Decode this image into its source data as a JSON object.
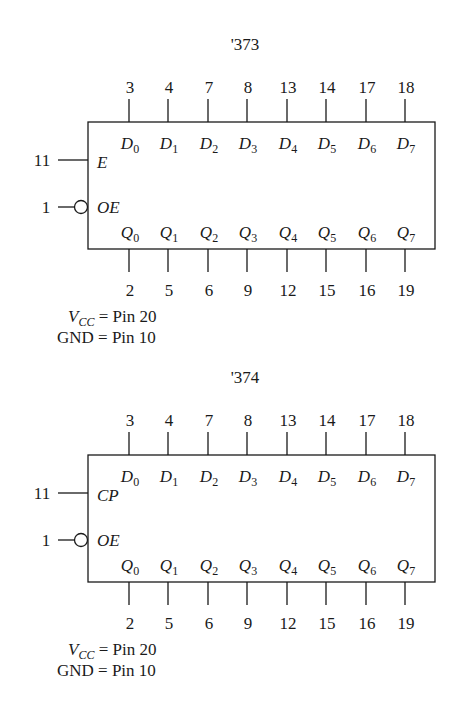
{
  "diagrams": [
    {
      "title": "'373",
      "control_top": {
        "pin": "11",
        "label": "E"
      },
      "control_bottom": {
        "pin": "1",
        "label": "OE",
        "inverted": true
      },
      "inputs": [
        {
          "pin": "3",
          "name": "D",
          "sub": "0"
        },
        {
          "pin": "4",
          "name": "D",
          "sub": "1"
        },
        {
          "pin": "7",
          "name": "D",
          "sub": "2"
        },
        {
          "pin": "8",
          "name": "D",
          "sub": "3"
        },
        {
          "pin": "13",
          "name": "D",
          "sub": "4"
        },
        {
          "pin": "14",
          "name": "D",
          "sub": "5"
        },
        {
          "pin": "17",
          "name": "D",
          "sub": "6"
        },
        {
          "pin": "18",
          "name": "D",
          "sub": "7"
        }
      ],
      "outputs": [
        {
          "pin": "2",
          "name": "Q",
          "sub": "0"
        },
        {
          "pin": "5",
          "name": "Q",
          "sub": "1"
        },
        {
          "pin": "6",
          "name": "Q",
          "sub": "2"
        },
        {
          "pin": "9",
          "name": "Q",
          "sub": "3"
        },
        {
          "pin": "12",
          "name": "Q",
          "sub": "4"
        },
        {
          "pin": "15",
          "name": "Q",
          "sub": "5"
        },
        {
          "pin": "16",
          "name": "Q",
          "sub": "6"
        },
        {
          "pin": "19",
          "name": "Q",
          "sub": "7"
        }
      ],
      "power": {
        "vcc_label": "V",
        "vcc_sub": "CC",
        "vcc_text": " = Pin 20",
        "gnd_text": "GND = Pin 10"
      }
    },
    {
      "title": "'374",
      "control_top": {
        "pin": "11",
        "label": "CP"
      },
      "control_bottom": {
        "pin": "1",
        "label": "OE",
        "inverted": true
      },
      "inputs": [
        {
          "pin": "3",
          "name": "D",
          "sub": "0"
        },
        {
          "pin": "4",
          "name": "D",
          "sub": "1"
        },
        {
          "pin": "7",
          "name": "D",
          "sub": "2"
        },
        {
          "pin": "8",
          "name": "D",
          "sub": "3"
        },
        {
          "pin": "13",
          "name": "D",
          "sub": "4"
        },
        {
          "pin": "14",
          "name": "D",
          "sub": "5"
        },
        {
          "pin": "17",
          "name": "D",
          "sub": "6"
        },
        {
          "pin": "18",
          "name": "D",
          "sub": "7"
        }
      ],
      "outputs": [
        {
          "pin": "2",
          "name": "Q",
          "sub": "0"
        },
        {
          "pin": "5",
          "name": "Q",
          "sub": "1"
        },
        {
          "pin": "6",
          "name": "Q",
          "sub": "2"
        },
        {
          "pin": "9",
          "name": "Q",
          "sub": "3"
        },
        {
          "pin": "12",
          "name": "Q",
          "sub": "4"
        },
        {
          "pin": "15",
          "name": "Q",
          "sub": "5"
        },
        {
          "pin": "16",
          "name": "Q",
          "sub": "6"
        },
        {
          "pin": "19",
          "name": "Q",
          "sub": "7"
        }
      ],
      "power": {
        "vcc_label": "V",
        "vcc_sub": "CC",
        "vcc_text": " = Pin 20",
        "gnd_text": "GND = Pin 10"
      }
    }
  ]
}
